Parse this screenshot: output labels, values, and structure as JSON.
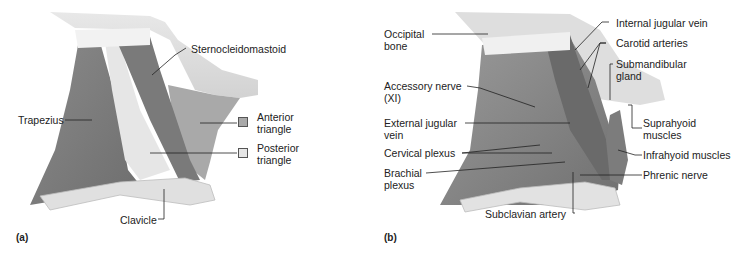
{
  "figure": {
    "panels": [
      {
        "id": "a",
        "label": "(a)",
        "labels": {
          "sternocleidomastoid": "Sternocleidomastoid",
          "trapezius": "Trapezius",
          "clavicle": "Clavicle",
          "anterior_triangle_1": "Anterior",
          "anterior_triangle_2": "triangle",
          "posterior_triangle_1": "Posterior",
          "posterior_triangle_2": "triangle"
        },
        "legend": [
          {
            "name": "Anterior triangle",
            "color": "#a9a9a9"
          },
          {
            "name": "Posterior triangle",
            "color": "#e6e6e6"
          }
        ]
      },
      {
        "id": "b",
        "label": "(b)",
        "labels": {
          "occipital_1": "Occipital",
          "occipital_2": "bone",
          "accessory_1": "Accessory nerve",
          "accessory_2": "(XI)",
          "ext_jugular_1": "External jugular",
          "ext_jugular_2": "vein",
          "cervical_plexus": "Cervical plexus",
          "brachial_1": "Brachial",
          "brachial_2": "plexus",
          "subclavian_artery": "Subclavian artery",
          "internal_jugular": "Internal jugular vein",
          "carotid": "Carotid arteries",
          "submandibular_1": "Submandibular",
          "submandibular_2": "gland",
          "suprahyoid_1": "Suprahyoid",
          "suprahyoid_2": "muscles",
          "infrahyoid": "Infrahyoid muscles",
          "phrenic": "Phrenic nerve"
        }
      }
    ]
  }
}
